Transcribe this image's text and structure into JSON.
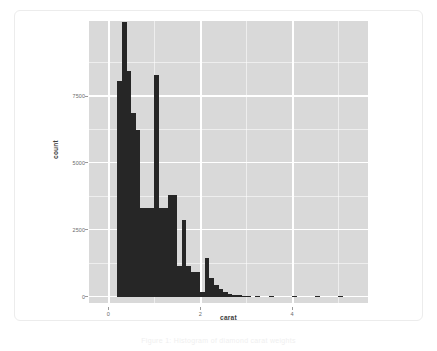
{
  "figure": {
    "panel_background": "#d9d9d9",
    "grid_color": "#ffffff",
    "bar_color": "#262626",
    "card_background": "#ffffff"
  },
  "caption": {
    "text": "Figure 1: Histogram of diamond carat weights"
  },
  "chart_data": {
    "type": "bar",
    "subtype": "histogram",
    "title": "",
    "subtitle": "",
    "xlabel": "carat",
    "ylabel": "count",
    "xlim": [
      -0.42,
      5.65
    ],
    "ylim": [
      -220,
      10330
    ],
    "binwidth": 0.1,
    "grid": true,
    "legend": null,
    "x_ticks": [
      0,
      2,
      4
    ],
    "x_tick_labels": [
      "0",
      "2",
      "4"
    ],
    "x_minor_ticks": [
      1,
      3,
      5
    ],
    "y_ticks": [
      0,
      2500,
      5000,
      7500
    ],
    "y_tick_labels": [
      "0",
      "2500",
      "5000",
      "7500"
    ],
    "y_minor_ticks": [
      1250,
      3750,
      6250,
      8750
    ],
    "bin_centers": [
      0.25,
      0.35,
      0.45,
      0.55,
      0.65,
      0.75,
      0.85,
      0.95,
      1.05,
      1.15,
      1.25,
      1.35,
      1.45,
      1.55,
      1.65,
      1.75,
      1.85,
      1.95,
      2.05,
      2.15,
      2.25,
      2.35,
      2.45,
      2.55,
      2.65,
      2.75,
      2.85,
      2.95,
      3.05,
      3.25,
      3.55,
      4.05,
      4.55,
      5.05
    ],
    "values": [
      8100,
      10300,
      8450,
      6900,
      6250,
      3350,
      3350,
      3350,
      8300,
      3350,
      3350,
      3800,
      3800,
      1150,
      2900,
      1150,
      950,
      950,
      200,
      1450,
      700,
      450,
      300,
      200,
      130,
      90,
      60,
      40,
      30,
      18,
      10,
      6,
      3,
      2
    ]
  }
}
